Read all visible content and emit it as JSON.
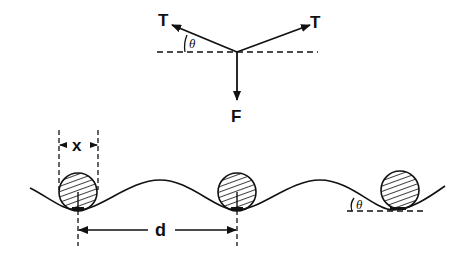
{
  "diagram": {
    "force_diagram": {
      "tension_left_label": "T",
      "tension_right_label": "T",
      "weight_label": "F",
      "angle_label": "θ"
    },
    "wave_diagram": {
      "width_label": "x",
      "spacing_label": "d",
      "angle_label": "θ"
    },
    "colors": {
      "ink": "#111111",
      "background": "#ffffff"
    }
  }
}
